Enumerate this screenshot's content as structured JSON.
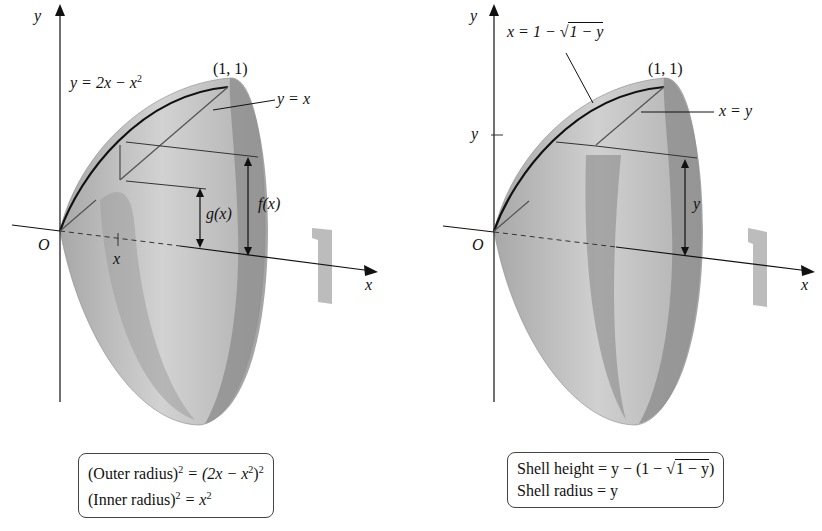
{
  "figure": {
    "left": {
      "axis_y_label": "y",
      "axis_x_label": "x",
      "origin_label": "O",
      "tick_x_label": "x",
      "curve_label": "y = 2x − x²",
      "curve_label_parts": {
        "pre": "y = 2x − x",
        "sup": "2"
      },
      "point_label": "(1, 1)",
      "line_label": "y = x",
      "outer_radius_label": "f(x)",
      "inner_radius_label": "g(x)",
      "formula_box": {
        "line1": {
          "pre": "(Outer radius)",
          "sup1": "2",
          "mid": " = (2x − x",
          "sup2": "2",
          "post": ")",
          "sup3": "2"
        },
        "line2": {
          "pre": "(Inner radius)",
          "sup1": "2",
          "mid": " = x",
          "sup2": "2"
        }
      }
    },
    "right": {
      "axis_y_label": "y",
      "axis_x_label": "x",
      "origin_label": "O",
      "tick_y_label": "y",
      "curve_label": {
        "pre": "x = 1 − ",
        "radical": "√",
        "radicand": "1 − y"
      },
      "point_label": "(1, 1)",
      "line_label": "x = y",
      "height_label": "y",
      "formula_box": {
        "line1": {
          "pre": "Shell height = y − (1 − ",
          "radical": "√",
          "radicand": "1 − y",
          "post": ")"
        },
        "line2": "Shell radius = y"
      }
    },
    "icons": [
      "rotation-arrow-icon",
      "rotation-arrow-icon"
    ],
    "colors": {
      "surface_light": "#d6d6d6",
      "surface_mid": "#bdbdbd",
      "surface_dark": "#9a9a9a",
      "axis": "#111111",
      "rotation_arrow": "#bcbcbc"
    }
  }
}
